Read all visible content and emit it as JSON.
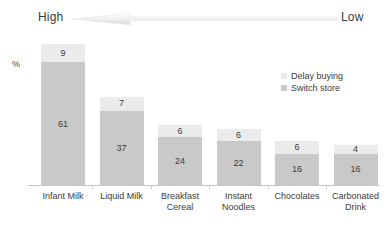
{
  "axis_arrow": {
    "left_label": "High",
    "right_label": "Low",
    "icon": "left-arrow-gradient"
  },
  "y_axis_title": "%",
  "legend": {
    "items": [
      {
        "label": "Delay buying",
        "color": "#ebebeb",
        "swatch_icon": "legend-swatch-icon"
      },
      {
        "label": "Switch store",
        "color": "#c9c9c9",
        "swatch_icon": "legend-swatch-icon"
      }
    ]
  },
  "chart_data": {
    "type": "bar",
    "subtype": "stacked-vertical",
    "title": "",
    "xlabel": "",
    "ylabel": "%",
    "ylim": [
      0,
      75
    ],
    "grid": false,
    "legend_position": "right-inside",
    "annotations": [
      "High",
      "Low"
    ],
    "categories": [
      "Infant Milk",
      "Liquid Milk",
      "Breakfast Cereal",
      "Instant Noodles",
      "Chocolates",
      "Carbonated Drink"
    ],
    "category_lines": [
      [
        "Infant Milk"
      ],
      [
        "Liquid Milk"
      ],
      [
        "Breakfast",
        "Cereal"
      ],
      [
        "Instant",
        "Noodles"
      ],
      [
        "Chocolates"
      ],
      [
        "Carbonated",
        "Drink"
      ]
    ],
    "series": [
      {
        "name": "Switch store",
        "color": "#c9c9c9",
        "values": [
          61,
          37,
          24,
          22,
          16,
          16
        ]
      },
      {
        "name": "Delay buying",
        "color": "#ebebeb",
        "values": [
          9,
          7,
          6,
          6,
          6,
          4
        ]
      }
    ],
    "totals": [
      70,
      44,
      30,
      28,
      22,
      20
    ]
  }
}
